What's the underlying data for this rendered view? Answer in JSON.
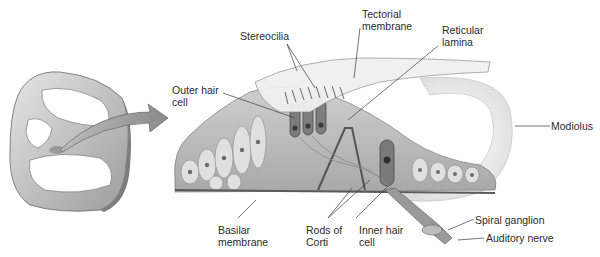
{
  "figure": {
    "palette": {
      "ink": "#2a2a2a",
      "leader": "#3a3a3a",
      "tissue_light": "#d9d9d9",
      "tissue_mid": "#b3b3b3",
      "tissue_dark": "#6e6e6e",
      "hair_cell": "#7a7a7a",
      "membrane": "#e8e8e8",
      "background": "#ffffff"
    }
  },
  "labels": {
    "stereocilia": "Stereocilia",
    "tectorial_membrane": "Tectorial\nmembrane",
    "reticular_lamina": "Reticular\nlamina",
    "outer_hair_cell": "Outer hair\ncell",
    "modiolus": "Modiolus",
    "basilar_membrane": "Basilar\nmembrane",
    "rods_of_corti": "Rods of\nCorti",
    "inner_hair_cell": "Inner hair\ncell",
    "spiral_ganglion": "Spiral ganglion",
    "auditory_nerve": "Auditory nerve"
  }
}
